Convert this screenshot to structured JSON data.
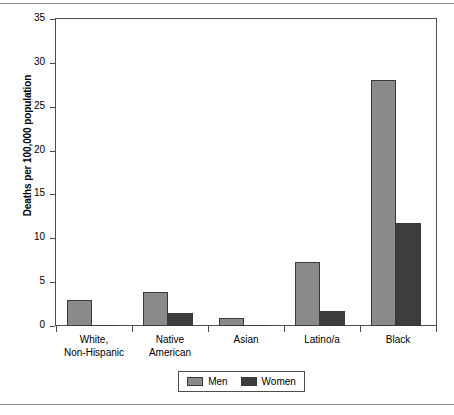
{
  "chart_data": {
    "type": "bar",
    "title": "",
    "subtitle": "",
    "xlabel": "",
    "ylabel": "Deaths per 100,000 population",
    "ylim": [
      0,
      35
    ],
    "yticks": [
      0,
      5,
      10,
      15,
      20,
      25,
      30,
      35
    ],
    "ytick_labels": [
      "0",
      "5",
      "10",
      "15",
      "20",
      "25",
      "30",
      "35"
    ],
    "grid": false,
    "legend_position": "bottom-center",
    "categories": [
      "White,\nNon-Hispanic",
      "Native\nAmerican",
      "Asian",
      "Latino/a",
      "Black"
    ],
    "category_lines": [
      [
        "White,",
        "Non-Hispanic"
      ],
      [
        "Native",
        "American"
      ],
      [
        "Asian",
        ""
      ],
      [
        "Latino/a",
        ""
      ],
      [
        "Black",
        ""
      ]
    ],
    "series": [
      {
        "name": "Men",
        "color": "#8a8a8a",
        "values": [
          3.0,
          3.9,
          0.9,
          7.3,
          28.0
        ]
      },
      {
        "name": "Women",
        "color": "#3d3d3d",
        "values": [
          0.1,
          1.5,
          0.05,
          1.7,
          11.7
        ]
      }
    ]
  },
  "legend": {
    "entries": [
      {
        "label": "Men"
      },
      {
        "label": "Women"
      }
    ]
  },
  "colors": {
    "men": "#8a8a8a",
    "women": "#3d3d3d",
    "axis": "#4d4d4d",
    "bar_outline": "#3a3a3a",
    "rule": "#8c8c8c"
  }
}
